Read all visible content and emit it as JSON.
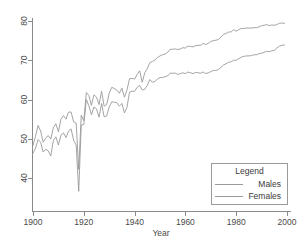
{
  "chart_data": {
    "type": "line",
    "title": "",
    "xlabel": "Year",
    "ylabel": "",
    "xlim": [
      1900,
      2000
    ],
    "ylim": [
      36,
      81
    ],
    "grid": false,
    "legend": {
      "title": "Legend",
      "position": "bottom-right",
      "entries": [
        "Males",
        "Females"
      ]
    },
    "xticks": [
      1900,
      1920,
      1940,
      1960,
      1980,
      2000
    ],
    "xtick_labels": [
      "1900",
      "1920",
      "1940",
      "1960",
      "1980",
      "2000"
    ],
    "yticks": [
      40,
      50,
      60,
      70,
      80
    ],
    "ytick_labels": [
      "40",
      "50",
      "60",
      "70",
      "80"
    ],
    "x": [
      1900,
      1901,
      1902,
      1903,
      1904,
      1905,
      1906,
      1907,
      1908,
      1909,
      1910,
      1911,
      1912,
      1913,
      1914,
      1915,
      1916,
      1917,
      1918,
      1919,
      1920,
      1921,
      1922,
      1923,
      1924,
      1925,
      1926,
      1927,
      1928,
      1929,
      1930,
      1931,
      1932,
      1933,
      1934,
      1935,
      1936,
      1937,
      1938,
      1939,
      1940,
      1941,
      1942,
      1943,
      1944,
      1945,
      1946,
      1947,
      1948,
      1949,
      1950,
      1951,
      1952,
      1953,
      1954,
      1955,
      1956,
      1957,
      1958,
      1959,
      1960,
      1961,
      1962,
      1963,
      1964,
      1965,
      1966,
      1967,
      1968,
      1969,
      1970,
      1971,
      1972,
      1973,
      1974,
      1975,
      1976,
      1977,
      1978,
      1979,
      1980,
      1981,
      1982,
      1983,
      1984,
      1985,
      1986,
      1987,
      1988,
      1989,
      1990,
      1991,
      1992,
      1993,
      1994,
      1995,
      1996,
      1997,
      1998,
      1999
    ],
    "series": [
      {
        "name": "Males",
        "values": [
          46.3,
          47.6,
          49.8,
          49.1,
          46.6,
          47.3,
          46.9,
          45.6,
          49.5,
          50.5,
          48.4,
          50.9,
          51.5,
          50.3,
          52.0,
          52.5,
          49.6,
          48.4,
          36.6,
          53.5,
          53.6,
          60.0,
          58.4,
          56.1,
          58.1,
          57.6,
          55.5,
          59.0,
          55.6,
          55.8,
          58.1,
          59.4,
          59.3,
          59.2,
          58.3,
          59.0,
          56.6,
          58.0,
          61.9,
          62.1,
          62.1,
          63.1,
          63.6,
          62.4,
          62.6,
          63.6,
          65.1,
          64.4,
          64.6,
          65.2,
          65.6,
          65.6,
          65.8,
          66.0,
          66.7,
          66.7,
          66.7,
          66.4,
          66.6,
          66.8,
          66.6,
          67.0,
          66.8,
          66.6,
          66.9,
          66.8,
          66.7,
          67.0,
          66.6,
          66.8,
          67.1,
          67.4,
          67.4,
          67.6,
          68.2,
          68.8,
          69.1,
          69.5,
          69.6,
          70.0,
          70.0,
          70.4,
          70.8,
          71.0,
          71.1,
          71.1,
          71.2,
          71.4,
          71.4,
          71.7,
          71.8,
          72.0,
          72.3,
          72.2,
          72.4,
          72.5,
          73.1,
          73.6,
          73.8,
          73.9
        ]
      },
      {
        "name": "Females",
        "values": [
          48.3,
          50.6,
          53.4,
          52.0,
          49.1,
          50.2,
          50.8,
          49.9,
          52.8,
          53.8,
          51.8,
          55.0,
          55.9,
          55.0,
          56.8,
          56.8,
          54.3,
          54.0,
          42.2,
          56.0,
          54.6,
          61.8,
          61.0,
          58.5,
          61.2,
          60.6,
          58.7,
          62.1,
          58.3,
          58.7,
          61.6,
          63.1,
          62.8,
          62.4,
          61.6,
          62.9,
          60.6,
          62.4,
          65.3,
          65.4,
          65.2,
          66.4,
          67.3,
          64.4,
          66.8,
          67.9,
          69.4,
          69.7,
          70.0,
          70.7,
          71.1,
          71.4,
          71.6,
          72.0,
          72.8,
          72.8,
          72.9,
          72.7,
          72.9,
          73.2,
          73.1,
          73.6,
          73.5,
          73.4,
          73.7,
          73.8,
          73.8,
          74.3,
          74.0,
          74.3,
          74.8,
          75.0,
          75.1,
          75.3,
          75.9,
          76.6,
          76.8,
          77.2,
          77.2,
          77.8,
          77.4,
          77.8,
          78.1,
          78.1,
          78.2,
          78.2,
          78.2,
          78.3,
          78.3,
          78.5,
          78.8,
          78.9,
          79.1,
          78.8,
          79.0,
          78.9,
          79.1,
          79.4,
          79.5,
          79.4
        ]
      }
    ]
  },
  "axes": {
    "xlabel": "Year"
  },
  "legend": {
    "title": "Legend",
    "males_label": "Males",
    "females_label": "Females"
  },
  "colors": {
    "line": "#9a9a9a",
    "axis": "#8a8a8a",
    "text": "#3a3a3a",
    "background": "#ffffff"
  }
}
